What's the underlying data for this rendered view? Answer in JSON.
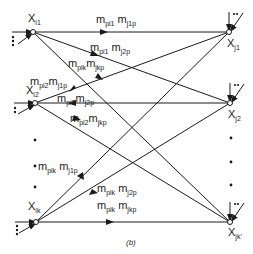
{
  "diagram": {
    "caption": "(b)",
    "colors": {
      "line": "#1a1a1a",
      "background": "#ffffff"
    },
    "source_nodes": [
      {
        "id": "xi1",
        "label": "X",
        "sub": "i1",
        "x": 33,
        "y": 32
      },
      {
        "id": "xi2",
        "label": "X",
        "sub": "i2",
        "x": 35,
        "y": 103
      },
      {
        "id": "xik",
        "label": "X",
        "sub": "ik",
        "x": 36,
        "y": 222
      }
    ],
    "target_nodes": [
      {
        "id": "xj1",
        "label": "X",
        "sub": "j1",
        "x": 229,
        "y": 32
      },
      {
        "id": "xj2",
        "label": "X",
        "sub": "j2",
        "x": 230,
        "y": 103
      },
      {
        "id": "xjk",
        "label": "X",
        "sub": "jk'",
        "x": 230,
        "y": 222
      }
    ],
    "edge_labels": [
      {
        "text": "m",
        "sub1": "pi1",
        "m2": "m",
        "sub2": "j1p",
        "x": 96,
        "y": 14
      },
      {
        "text": "m",
        "sub1": "pi1",
        "m2": "m",
        "sub2": "j2p",
        "x": 90,
        "y": 44
      },
      {
        "text": "m",
        "sub1": "pik",
        "m2": "m",
        "sub2": "jkp",
        "x": 70,
        "y": 60
      },
      {
        "text": "m",
        "sub1": "pi2",
        "m2": "m",
        "sub2": "j1p",
        "x": 30,
        "y": 77
      },
      {
        "text": "m",
        "sub1": "pi2",
        "m2": "m",
        "sub2": "j2p",
        "x": 58,
        "y": 94
      },
      {
        "text": "m",
        "sub1": "pi2",
        "m2": "m",
        "sub2": "jkp",
        "x": 70,
        "y": 114
      },
      {
        "text": "m",
        "sub1": "pik",
        "m2": "m",
        "sub2": "j1p",
        "x": 38,
        "y": 162
      },
      {
        "text": "m",
        "sub1": "pik",
        "m2": "m",
        "sub2": "j2p",
        "x": 97,
        "y": 183
      },
      {
        "text": "m",
        "sub1": "pik",
        "m2": "m",
        "sub2": "jkp",
        "x": 97,
        "y": 200
      }
    ],
    "ellipsis_left": "vertical dots between Xi2 and Xik",
    "ellipsis_right": "vertical dots between Xj2 and Xjk'"
  }
}
